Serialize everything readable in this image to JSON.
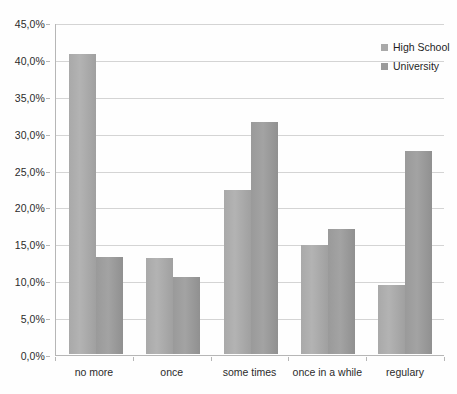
{
  "chart_data": {
    "type": "bar",
    "title": "",
    "subtitle": "",
    "xlabel": "",
    "ylabel": "",
    "categories": [
      "no more",
      "once",
      "some times",
      "once in a while",
      "regulary"
    ],
    "series": [
      {
        "name": "High School",
        "color": "#a9a9a9",
        "values": [
          40.7,
          13.0,
          22.2,
          14.8,
          9.3
        ]
      },
      {
        "name": "University",
        "color": "#9a9a9a",
        "values": [
          13.1,
          10.4,
          31.5,
          16.9,
          27.5
        ]
      }
    ],
    "ylim": [
      0,
      45
    ],
    "ytick_values": [
      0,
      5,
      10,
      15,
      20,
      25,
      30,
      35,
      40,
      45
    ],
    "ytick_labels": [
      "0,0%",
      "5,0%",
      "10,0%",
      "15,0%",
      "20,0%",
      "25,0%",
      "30,0%",
      "35,0%",
      "40,0%",
      "45,0%"
    ],
    "grid": true,
    "grid_axis": "y",
    "legend_position": "top-right",
    "legend_entries": [
      "High School",
      "University"
    ],
    "value_format": "percent-comma-decimal",
    "background_color": "#ffffff",
    "gridline_color": "#d4d4d4",
    "axis_color": "#b6b6b6"
  }
}
